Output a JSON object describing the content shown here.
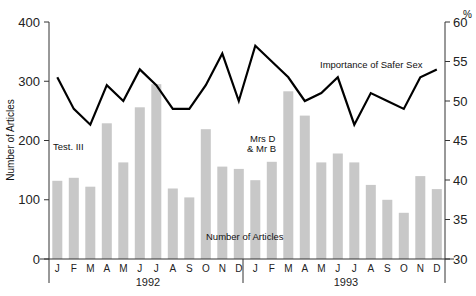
{
  "chart_data": {
    "type": "bar+line",
    "title": "",
    "xlabel": "",
    "ylabel": "Number of Articles",
    "ylabel_right": "%",
    "ylim": [
      0,
      400
    ],
    "ylim_right": [
      30,
      60
    ],
    "yticks": [
      0,
      100,
      200,
      300,
      400
    ],
    "yticks_right": [
      30,
      35,
      40,
      45,
      50,
      55,
      60
    ],
    "grid": false,
    "years": [
      {
        "label": "1992",
        "months": [
          "J",
          "F",
          "M",
          "A",
          "M",
          "J",
          "J",
          "A",
          "S",
          "O",
          "N",
          "D"
        ]
      },
      {
        "label": "1993",
        "months": [
          "J",
          "F",
          "M",
          "A",
          "M",
          "J",
          "J",
          "A",
          "S",
          "O",
          "N",
          "D"
        ]
      }
    ],
    "categories": [
      "J 1992",
      "F 1992",
      "M 1992",
      "A 1992",
      "M 1992",
      "J 1992",
      "J 1992",
      "A 1992",
      "S 1992",
      "O 1992",
      "N 1992",
      "D 1992",
      "J 1993",
      "F 1993",
      "M 1993",
      "A 1993",
      "M 1993",
      "J 1993",
      "J 1993",
      "A 1993",
      "S 1993",
      "O 1993",
      "N 1993",
      "D 1993"
    ],
    "series": [
      {
        "name": "Number of Articles",
        "type": "bar",
        "axis": "left",
        "color": "#c8c8c8",
        "values": [
          132,
          137,
          122,
          229,
          163,
          256,
          295,
          119,
          104,
          219,
          156,
          152,
          133,
          164,
          283,
          242,
          163,
          178,
          163,
          125,
          100,
          78,
          140,
          118
        ]
      },
      {
        "name": "Importance of Safer Sex",
        "type": "line",
        "axis": "right",
        "color": "#000000",
        "values": [
          53,
          49,
          47,
          52,
          50,
          54,
          52,
          49,
          49,
          52,
          56,
          50,
          57,
          55,
          53,
          50,
          51,
          53,
          47,
          51,
          50,
          49,
          53,
          54
        ]
      }
    ],
    "annotations": [
      {
        "text": "Test. III",
        "index": 0
      },
      {
        "text": "Mrs D",
        "index": 13
      },
      {
        "text": "& Mr B",
        "index": 13
      },
      {
        "text": "Importance of Safer Sex",
        "index": 18
      },
      {
        "text": "Number of Articles",
        "index": 12
      }
    ]
  }
}
